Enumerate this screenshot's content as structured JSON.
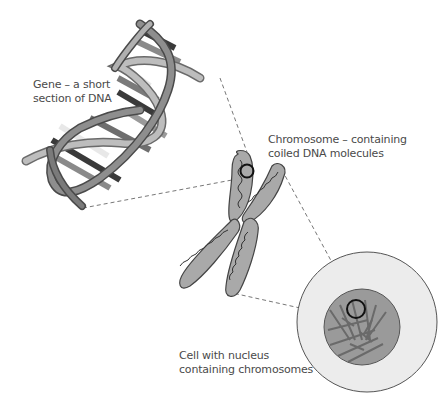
{
  "diagram": {
    "type": "biology-hierarchy",
    "colors": {
      "background": "#ffffff",
      "text": "#4a4a4a",
      "strand_light": "#b8b8b8",
      "strand_dark": "#6e6e6e",
      "base_dark": "#3a3a3a",
      "gene_highlight": "#e6e6e6",
      "chromosome_fill": "#a9a9a9",
      "cell_fill": "#ececec",
      "nucleus_fill": "#9a9a9a",
      "focus_ring": "#111111",
      "dashed_line": "#777777"
    },
    "nodes": [
      {
        "id": "gene",
        "label_lines": [
          "Gene – a short",
          "section of DNA"
        ]
      },
      {
        "id": "chromosome",
        "label_lines": [
          "Chromosome – containing",
          "coiled DNA molecules"
        ]
      },
      {
        "id": "cell",
        "label_lines": [
          "Cell with nucleus",
          "containing chromosomes"
        ]
      }
    ],
    "edges": [
      {
        "from": "chromosome",
        "to": "gene",
        "style": "dashed",
        "meaning": "zoom-in"
      },
      {
        "from": "cell",
        "to": "chromosome",
        "style": "dashed",
        "meaning": "zoom-in"
      }
    ]
  },
  "labels": {
    "gene": {
      "line1": "Gene – a short",
      "line2": "section of DNA"
    },
    "chromosome": {
      "line1": "Chromosome – containing",
      "line2": "coiled DNA molecules"
    },
    "cell": {
      "line1": "Cell with nucleus",
      "line2": "containing chromosomes"
    }
  }
}
